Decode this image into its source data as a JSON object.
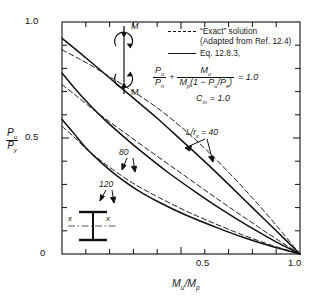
{
  "chart_data": {
    "type": "line",
    "title": "",
    "xlabel": "Mu/Mp",
    "ylabel": "Pu/Py",
    "xlim": [
      0,
      1.0
    ],
    "ylim": [
      0,
      1.0
    ],
    "grid": false,
    "legend_position": "top-right-inside",
    "x_ticks": [
      0,
      0.1,
      0.2,
      0.3,
      0.4,
      0.5,
      0.6,
      0.7,
      0.8,
      0.9,
      1.0
    ],
    "x_tick_labels": [
      "",
      "",
      "",
      "",
      "",
      "0.5",
      "",
      "",
      "",
      "",
      "1.0"
    ],
    "y_ticks": [
      0,
      0.1,
      0.2,
      0.3,
      0.4,
      0.5,
      0.6,
      0.7,
      0.8,
      0.9,
      1.0
    ],
    "y_tick_labels": [
      "0",
      "",
      "",
      "",
      "",
      "0.5",
      "",
      "",
      "",
      "",
      "1.0"
    ],
    "series": [
      {
        "name": "Eq. 12.8.3, L/rx = 40",
        "style": "solid",
        "x": [
          0,
          0.06,
          0.13,
          0.21,
          0.3,
          0.4,
          0.5,
          0.6,
          0.7,
          0.8,
          0.9,
          1.0
        ],
        "y": [
          0.93,
          0.88,
          0.82,
          0.75,
          0.672,
          0.585,
          0.492,
          0.398,
          0.3,
          0.2,
          0.1,
          0.0
        ]
      },
      {
        "name": "\"Exact\" solution, L/rx = 40",
        "style": "dashed",
        "x": [
          0,
          0.06,
          0.13,
          0.21,
          0.3,
          0.4,
          0.5,
          0.6,
          0.7,
          0.8,
          0.9,
          1.0
        ],
        "y": [
          0.88,
          0.848,
          0.808,
          0.758,
          0.7,
          0.63,
          0.548,
          0.455,
          0.352,
          0.242,
          0.124,
          0.0
        ]
      },
      {
        "name": "Eq. 12.8.3, L/rx = 80",
        "style": "solid",
        "x": [
          0,
          0.05,
          0.11,
          0.18,
          0.26,
          0.35,
          0.45,
          0.56,
          0.67,
          0.78,
          0.89,
          1.0
        ],
        "y": [
          0.78,
          0.718,
          0.65,
          0.578,
          0.505,
          0.428,
          0.348,
          0.268,
          0.192,
          0.122,
          0.058,
          0.0
        ]
      },
      {
        "name": "\"Exact\" solution, L/rx = 80",
        "style": "dashed",
        "x": [
          0,
          0.05,
          0.11,
          0.18,
          0.26,
          0.35,
          0.45,
          0.56,
          0.67,
          0.78,
          0.89,
          1.0
        ],
        "y": [
          0.73,
          0.69,
          0.64,
          0.585,
          0.525,
          0.458,
          0.385,
          0.305,
          0.225,
          0.148,
          0.072,
          0.0
        ]
      },
      {
        "name": "Eq. 12.8.3, L/rx = 120",
        "style": "solid",
        "x": [
          0,
          0.05,
          0.1,
          0.16,
          0.23,
          0.31,
          0.41,
          0.52,
          0.64,
          0.76,
          0.88,
          1.0
        ],
        "y": [
          0.58,
          0.52,
          0.458,
          0.398,
          0.338,
          0.28,
          0.222,
          0.168,
          0.118,
          0.072,
          0.033,
          0.0
        ]
      },
      {
        "name": "\"Exact\" solution, L/rx = 120",
        "style": "dashed",
        "x": [
          0,
          0.05,
          0.1,
          0.16,
          0.23,
          0.31,
          0.41,
          0.52,
          0.64,
          0.76,
          0.88,
          1.0
        ],
        "y": [
          0.55,
          0.505,
          0.455,
          0.405,
          0.352,
          0.298,
          0.242,
          0.186,
          0.132,
          0.082,
          0.038,
          0.0
        ]
      }
    ],
    "annotations": [
      {
        "text": "L/rx = 40",
        "x": 0.52,
        "y": 0.46
      },
      {
        "text": "80",
        "x": 0.245,
        "y": 0.375
      },
      {
        "text": "120",
        "x": 0.165,
        "y": 0.245
      }
    ]
  },
  "axes": {
    "y_top_label": "1.0",
    "y_mid_label": "0.5",
    "y_zero_label": "0",
    "x_mid_label": "0.5",
    "x_max_label": "1.0",
    "y_title_num": "P",
    "y_title_num_sub": "u",
    "y_title_den": "P",
    "y_title_den_sub": "y",
    "x_title_num": "M",
    "x_title_num_sub": "u",
    "x_title_den": "M",
    "x_title_den_sub": "p"
  },
  "legend": {
    "exact_label": "“Exact” solution",
    "exact_source": "(Adapted from Ref. 12.4)",
    "eq_label": "Eq. 12.8.3,"
  },
  "equation": {
    "t1_num": "P",
    "t1_num_sub": "u",
    "t1_den": "P",
    "t1_den_sub": "n",
    "plus": "+",
    "t2_num": "M",
    "t2_num_sub": "u",
    "t2_den_a": "M",
    "t2_den_a_sub": "p",
    "t2_den_b": "(1 − ",
    "t2_den_c": "P",
    "t2_den_c_sub": "u",
    "t2_den_d": "/",
    "t2_den_e": "P",
    "t2_den_e_sub": "e",
    "t2_den_f": ")",
    "equals": "= 1.0",
    "cm_text": "C",
    "cm_sub": "m",
    "cm_value": "= 1.0"
  },
  "curve_labels": {
    "l40": "L/r",
    "l40_sub": "x",
    "l40_val": "= 40",
    "l80": "80",
    "l120": "120"
  },
  "diagrams": {
    "moment_top": "M",
    "moment_bottom": "M",
    "section_axis_left": "x",
    "section_axis_right": "x"
  },
  "colors": {
    "ink": "#111111",
    "background": "#ffffff"
  }
}
